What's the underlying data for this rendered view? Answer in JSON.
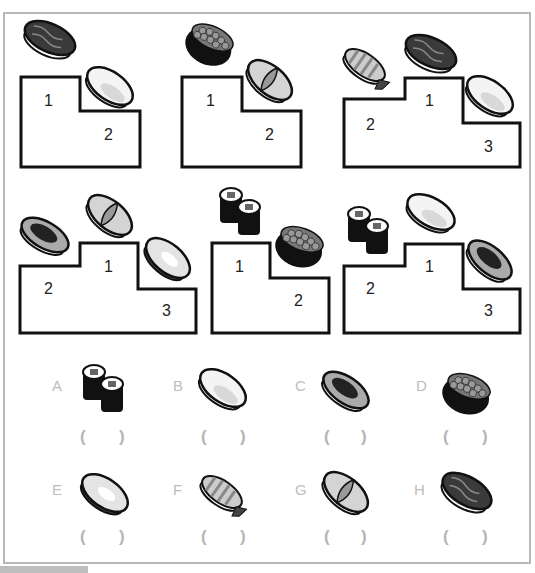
{
  "podiums": [
    {
      "places": [
        "1",
        "2"
      ],
      "sushi": [
        "tuna-nigiri",
        "squid-nigiri"
      ]
    },
    {
      "places": [
        "1",
        "2"
      ],
      "sushi": [
        "ikura-gunkan",
        "scallop-nigiri"
      ]
    },
    {
      "places": [
        "1",
        "2",
        "3"
      ],
      "sushi": [
        "tuna-nigiri",
        "shrimp-nigiri",
        "squid-nigiri"
      ]
    },
    {
      "places": [
        "1",
        "2",
        "3"
      ],
      "sushi": [
        "scallop-nigiri",
        "eel-nigiri",
        "clam-nigiri"
      ]
    },
    {
      "places": [
        "1",
        "2"
      ],
      "sushi": [
        "maki-rolls",
        "ikura-gunkan"
      ]
    },
    {
      "places": [
        "1",
        "2",
        "3"
      ],
      "sushi": [
        "squid-nigiri",
        "maki-rolls",
        "eel-nigiri"
      ]
    }
  ],
  "options": [
    {
      "letter": "A",
      "sushi": "maki-rolls",
      "open": "(",
      "close": ")"
    },
    {
      "letter": "B",
      "sushi": "squid-nigiri",
      "open": "(",
      "close": ")"
    },
    {
      "letter": "C",
      "sushi": "eel-nigiri",
      "open": "(",
      "close": ")"
    },
    {
      "letter": "D",
      "sushi": "ikura-gunkan",
      "open": "(",
      "close": ")"
    },
    {
      "letter": "E",
      "sushi": "clam-nigiri",
      "open": "(",
      "close": ")"
    },
    {
      "letter": "F",
      "sushi": "shrimp-nigiri",
      "open": "(",
      "close": ")"
    },
    {
      "letter": "G",
      "sushi": "scallop-nigiri",
      "open": "(",
      "close": ")"
    },
    {
      "letter": "H",
      "sushi": "tuna-nigiri",
      "open": "(",
      "close": ")"
    }
  ],
  "colors": {
    "frame": "#b8b8b8",
    "outline": "#111111",
    "label": "#bdbdbd"
  }
}
